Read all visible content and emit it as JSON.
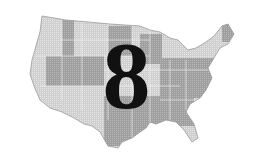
{
  "map": {
    "subject": "United States map",
    "numeral": "8",
    "colors": {
      "light_region": "#d4d4d4",
      "dark_region": "#a6a6a6",
      "border": "#eeeeee",
      "numeral": "#111111"
    }
  }
}
